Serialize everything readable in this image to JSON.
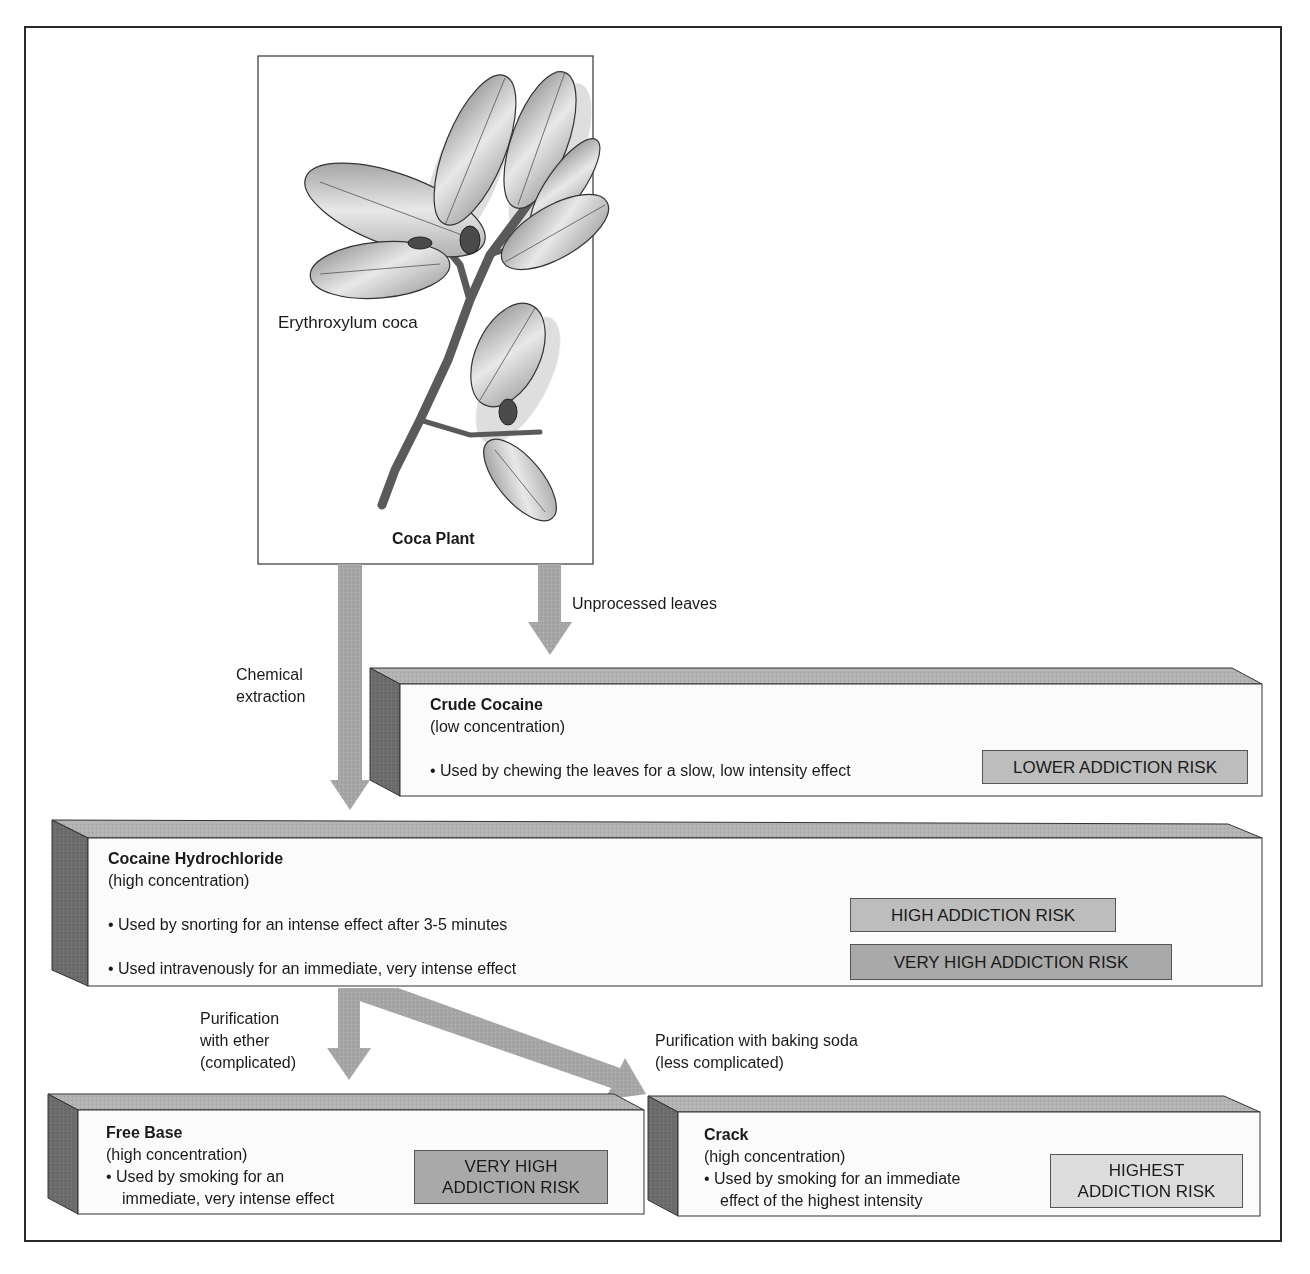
{
  "plant": {
    "species_label": "Erythroxylum coca",
    "caption": "Coca Plant"
  },
  "arrows": {
    "unprocessed": "Unprocessed leaves",
    "chemical_line1": "Chemical",
    "chemical_line2": "extraction",
    "ether_line1": "Purification",
    "ether_line2": "with ether",
    "ether_line3": "(complicated)",
    "baking_line1": "Purification with baking soda",
    "baking_line2": "(less complicated)"
  },
  "boxes": {
    "crude": {
      "title": "Crude Cocaine",
      "concentration": "(low concentration)",
      "uses": [
        "Used by chewing the leaves for a slow, low intensity effect"
      ],
      "risks": [
        "LOWER ADDICTION RISK"
      ]
    },
    "hydrochloride": {
      "title": "Cocaine Hydrochloride",
      "concentration": "(high concentration)",
      "uses": [
        "Used by snorting for an intense effect after 3-5 minutes",
        "Used intravenously for an immediate, very intense effect"
      ],
      "risks": [
        "HIGH ADDICTION RISK",
        "VERY HIGH ADDICTION RISK"
      ]
    },
    "freebase": {
      "title": "Free Base",
      "concentration": "(high concentration)",
      "use_line1": "Used by smoking for an",
      "use_line2": "immediate, very intense effect",
      "risk_line1": "VERY HIGH",
      "risk_line2": "ADDICTION RISK"
    },
    "crack": {
      "title": "Crack",
      "concentration": "(high concentration)",
      "use_line1": "Used by smoking for an immediate",
      "use_line2": "effect of the highest intensity",
      "risk_line1": "HIGHEST",
      "risk_line2": "ADDICTION RISK"
    }
  },
  "colors": {
    "arrow": "#a8a8a8",
    "box_face": "#fbfbfb",
    "box_top": "#b5b5b5",
    "box_side": "#6e6e6e",
    "border": "#2a2a2a"
  }
}
